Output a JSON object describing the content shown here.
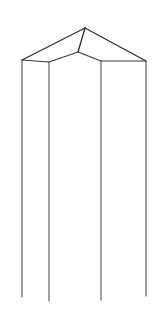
{
  "figure": {
    "type": "line-drawing",
    "background_color": "#ffffff",
    "stroke_color": "#3a3a3a",
    "stroke_color_vertical": "#4a4a4a",
    "stroke_color_top": "#2e2e2e",
    "canvas": {
      "width": 160,
      "height": 318
    },
    "vertices": {
      "apex": {
        "x": 85,
        "y": 28
      },
      "front_top": {
        "x": 78,
        "y": 52
      },
      "left_corner": {
        "x": 22,
        "y": 60
      },
      "left_front_corner": {
        "x": 49,
        "y": 62
      },
      "right_front_corner": {
        "x": 101,
        "y": 61
      },
      "right_corner": {
        "x": 146,
        "y": 61
      },
      "left_bottom": {
        "x": 22,
        "y": 297
      },
      "left_front_bottom": {
        "x": 49,
        "y": 301
      },
      "right_front_bottom": {
        "x": 101,
        "y": 300
      },
      "right_bottom": {
        "x": 146,
        "y": 296
      }
    },
    "edges": [
      {
        "name": "apex-to-left-corner",
        "from": "apex",
        "to": "left_corner"
      },
      {
        "name": "apex-to-right-corner",
        "from": "apex",
        "to": "right_corner"
      },
      {
        "name": "apex-to-front-top",
        "from": "apex",
        "to": "front_top"
      },
      {
        "name": "front-top-to-left-front-corner",
        "from": "front_top",
        "to": "left_front_corner"
      },
      {
        "name": "front-top-to-right-front-corner",
        "from": "front_top",
        "to": "right_front_corner"
      },
      {
        "name": "left-corner-to-left-front-corner",
        "from": "left_corner",
        "to": "left_front_corner"
      },
      {
        "name": "right-front-corner-to-right-corner",
        "from": "right_front_corner",
        "to": "right_corner"
      },
      {
        "name": "left-vertical",
        "from": "left_corner",
        "to": "left_bottom"
      },
      {
        "name": "left-front-vertical",
        "from": "left_front_corner",
        "to": "left_front_bottom"
      },
      {
        "name": "right-front-vertical",
        "from": "right_front_corner",
        "to": "right_front_bottom"
      },
      {
        "name": "right-vertical",
        "from": "right_corner",
        "to": "right_bottom"
      }
    ]
  }
}
